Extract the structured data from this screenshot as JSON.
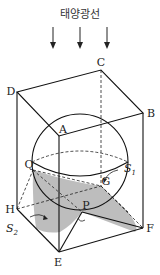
{
  "title": "태양광선",
  "labels": {
    "A": "A",
    "B": "B",
    "C": "C",
    "D": "D",
    "E": "E",
    "F": "F",
    "G": "G",
    "H": "H",
    "P": "P",
    "Q": "Q"
  },
  "regions": {
    "s1": {
      "base": "S",
      "sub": "1"
    },
    "s2": {
      "base": "S",
      "sub": "2"
    }
  },
  "colors": {
    "shadow": "#bdbdbd",
    "line": "#111111"
  }
}
